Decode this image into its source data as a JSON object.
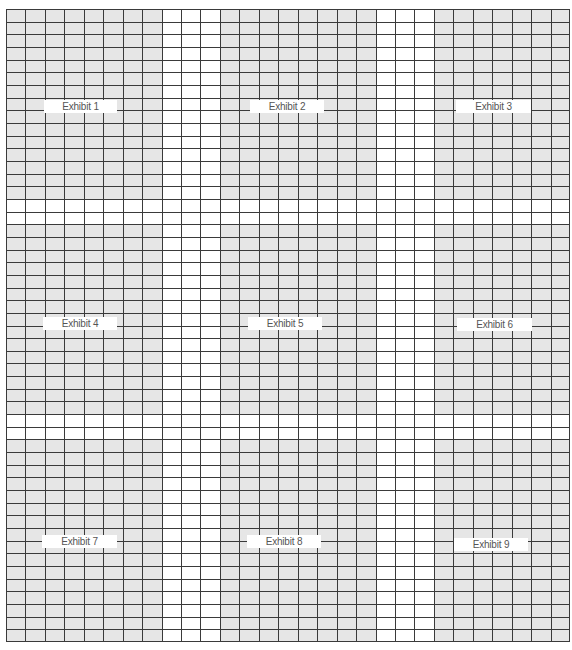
{
  "grid": {
    "columns": 29,
    "rows": 50,
    "fill_color": "#e6e6e6",
    "line_color": "#3a3a3a",
    "background": "#ffffff"
  },
  "exhibit_blocks": {
    "col_ranges": [
      [
        0,
        8
      ],
      [
        11,
        19
      ],
      [
        22,
        29
      ]
    ],
    "row_ranges": [
      [
        0,
        15
      ],
      [
        17,
        32
      ],
      [
        34,
        50
      ]
    ]
  },
  "exhibits": [
    {
      "label": "Exhibit 1",
      "x": 44,
      "y": 100,
      "w": 73
    },
    {
      "label": "Exhibit 2",
      "x": 250,
      "y": 100,
      "w": 74
    },
    {
      "label": "Exhibit 3",
      "x": 456,
      "y": 100,
      "w": 75
    },
    {
      "label": "Exhibit 4",
      "x": 43,
      "y": 317,
      "w": 74
    },
    {
      "label": "Exhibit 5",
      "x": 248,
      "y": 317,
      "w": 74
    },
    {
      "label": "Exhibit 6",
      "x": 457,
      "y": 318,
      "w": 75
    },
    {
      "label": "Exhibit 7",
      "x": 42,
      "y": 535,
      "w": 75
    },
    {
      "label": "Exhibit 8",
      "x": 247,
      "y": 535,
      "w": 74
    },
    {
      "label": "Exhibit 9",
      "x": 454,
      "y": 538,
      "w": 74
    }
  ]
}
